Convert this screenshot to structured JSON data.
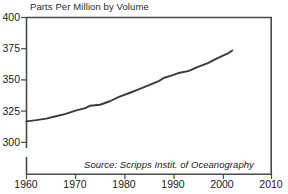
{
  "chart_data": {
    "type": "line",
    "title": "Parts Per Million by Volume",
    "xlabel": "",
    "ylabel": "",
    "xlim": [
      1960,
      2010
    ],
    "ylim": [
      287,
      400
    ],
    "grid": false,
    "legend": null,
    "annotations": [
      "Source: Scripps Instit. of Oceanography"
    ],
    "yticks": [
      400,
      375,
      350,
      325,
      300
    ],
    "ytick_labels": [
      "400",
      "375",
      "350",
      "325",
      "300"
    ],
    "xticks": [
      1960,
      1970,
      1980,
      1990,
      2000,
      2010
    ],
    "xtick_labels": [
      "1960",
      "1970",
      "1980",
      "1990",
      "2000",
      "2010"
    ],
    "axis_break_y": true,
    "series": [
      {
        "name": "Atmospheric CO2 concentration",
        "color": "#3a3a3a",
        "x": [
          1960,
          1962,
          1964,
          1966,
          1968,
          1970,
          1972,
          1973,
          1975,
          1977,
          1979,
          1981,
          1983,
          1985,
          1987,
          1988,
          1990,
          1991,
          1993,
          1995,
          1997,
          1999,
          2001,
          2002
        ],
        "values": [
          316.8,
          317.8,
          319.0,
          320.9,
          322.8,
          325.4,
          327.4,
          329.3,
          330.1,
          332.9,
          336.6,
          339.5,
          342.6,
          345.9,
          349.0,
          351.5,
          354.0,
          355.5,
          357.0,
          360.5,
          363.5,
          367.5,
          371.0,
          373.5
        ]
      }
    ]
  }
}
